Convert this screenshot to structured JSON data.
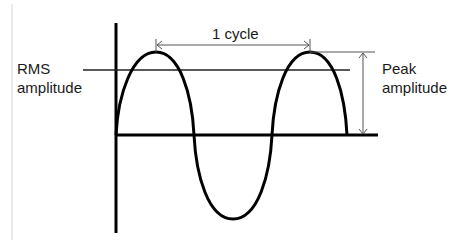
{
  "diagram": {
    "type": "sine-wave-amplitude-diagram",
    "labels": {
      "cycle": "1 cycle",
      "rms_line1": "RMS",
      "rms_line2": "amplitude",
      "peak_line1": "Peak",
      "peak_line2": "amplitude"
    },
    "colors": {
      "wave": "#000000",
      "axes": "#000000",
      "annotation_lines": "#555555",
      "text": "#1a1a1a",
      "frame_edge": "#d0d0d0",
      "background": "#ffffff"
    },
    "wave": {
      "cycles_shown": 1.5,
      "description": "sine wave starting at origin: positive peak, negative trough, positive peak, returning to axis"
    }
  }
}
